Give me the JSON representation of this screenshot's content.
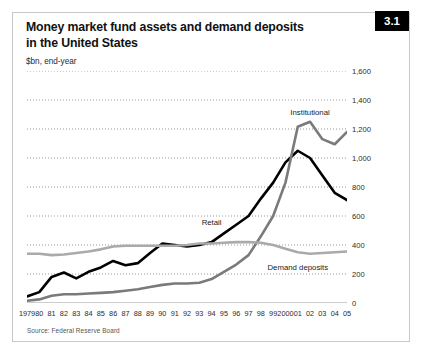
{
  "figure": {
    "number": "3.1",
    "title_line1": "Money market fund assets and demand deposits",
    "title_line2": "in the United States",
    "subtitle": "$bn, end-year",
    "source": "Source: Federal Reserve Board"
  },
  "chart_data": {
    "type": "line",
    "title": "Money market fund assets and demand deposits in the United States",
    "subtitle": "$bn, end-year",
    "xlabel": "",
    "ylabel": "$bn, end-year",
    "ylim": [
      0,
      1600
    ],
    "yticks": [
      0,
      200,
      400,
      600,
      800,
      1000,
      1200,
      1400,
      1600
    ],
    "ytick_labels": [
      "0",
      "200",
      "400",
      "600",
      "800",
      "1,000",
      "1,200",
      "1,400",
      "1,600"
    ],
    "grid": true,
    "legend": "inline-annotations",
    "x": [
      1979,
      1980,
      1981,
      1982,
      1983,
      1984,
      1985,
      1986,
      1987,
      1988,
      1989,
      1990,
      1991,
      1992,
      1993,
      1994,
      1995,
      1996,
      1997,
      1998,
      1999,
      2000,
      2001,
      2002,
      2003,
      2004,
      2005
    ],
    "xtick_labels": [
      "1979",
      "80",
      "81",
      "82",
      "83",
      "84",
      "85",
      "86",
      "87",
      "88",
      "89",
      "90",
      "91",
      "92",
      "93",
      "94",
      "95",
      "96",
      "97",
      "98",
      "99",
      "2000",
      "01",
      "02",
      "03",
      "04",
      "05"
    ],
    "series": [
      {
        "name": "Retail",
        "color": "#000000",
        "width": 2.6,
        "label_x": 1994,
        "label_y": 560,
        "values": [
          45,
          75,
          180,
          210,
          170,
          215,
          245,
          290,
          260,
          275,
          345,
          410,
          400,
          390,
          400,
          420,
          480,
          540,
          600,
          720,
          830,
          970,
          1050,
          1000,
          880,
          760,
          710
        ]
      },
      {
        "name": "Institutional",
        "color": "#7a7a7a",
        "width": 2.6,
        "label_x": 2002,
        "label_y": 1320,
        "values": [
          15,
          25,
          50,
          60,
          60,
          65,
          70,
          75,
          85,
          95,
          110,
          125,
          135,
          135,
          140,
          165,
          215,
          265,
          330,
          460,
          600,
          830,
          1215,
          1250,
          1130,
          1095,
          1180
        ]
      },
      {
        "name": "Demand deposits",
        "color": "#aaaaaa",
        "width": 2.6,
        "label_x": 2001,
        "label_y": 250,
        "values": [
          340,
          340,
          330,
          335,
          345,
          355,
          370,
          390,
          395,
          395,
          395,
          395,
          395,
          400,
          410,
          410,
          415,
          420,
          420,
          415,
          400,
          375,
          350,
          340,
          345,
          350,
          355
        ]
      }
    ]
  }
}
